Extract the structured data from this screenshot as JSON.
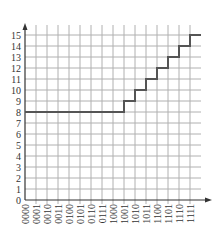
{
  "chart_data": {
    "type": "line",
    "style": "step",
    "title": "",
    "xlabel": "",
    "ylabel": "",
    "categories": [
      "0000",
      "0001",
      "0010",
      "0011",
      "0100",
      "0101",
      "0110",
      "0111",
      "1000",
      "1001",
      "1010",
      "1011",
      "1100",
      "1101",
      "1110",
      "1111"
    ],
    "values": [
      8,
      8,
      8,
      8,
      8,
      8,
      8,
      8,
      8,
      9,
      10,
      11,
      12,
      13,
      14,
      15
    ],
    "y_ticks": [
      0,
      1,
      2,
      3,
      4,
      5,
      6,
      7,
      8,
      9,
      10,
      11,
      12,
      13,
      14,
      15
    ],
    "ylim": [
      0,
      15
    ],
    "grid": true,
    "legend": null,
    "colors": {
      "grid": "#b0b0b0",
      "axis": "#333333",
      "line": "#555555"
    }
  }
}
